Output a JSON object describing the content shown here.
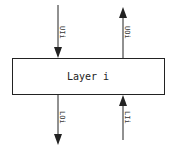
{
  "diagram": {
    "box": {
      "label": "Layer i"
    },
    "signals": [
      {
        "id": "top-left",
        "label": "UIi",
        "direction": "in-from-top"
      },
      {
        "id": "top-right",
        "label": "UOi",
        "direction": "out-to-top"
      },
      {
        "id": "bottom-left",
        "label": "LOi",
        "direction": "out-to-bottom"
      },
      {
        "id": "bottom-right",
        "label": "LIi",
        "direction": "in-from-bottom"
      }
    ],
    "colors": {
      "stroke": "#222222",
      "background": "#ffffff"
    }
  }
}
